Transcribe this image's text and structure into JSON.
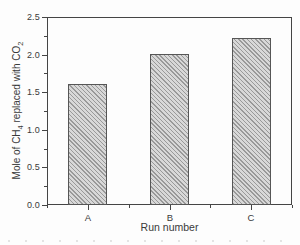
{
  "figure": {
    "background": "#fdfdfd",
    "axis_color": "#454545",
    "text_color": "#3a3a3a",
    "bar_fill": "#d8d8d8",
    "bar_hatch_color": "#999999",
    "bar_border_color": "#565656"
  },
  "chart_data": {
    "type": "bar",
    "title": "",
    "categories": [
      "A",
      "B",
      "C"
    ],
    "values": [
      1.61,
      2.01,
      2.22
    ],
    "xlabel": "Run number",
    "ylabel": "Mole of CH4 replaced with CO2",
    "ylabel_parts": [
      "Mole of CH",
      "4",
      " replaced with CO",
      "2"
    ],
    "ylim": [
      0,
      2.5
    ],
    "y_tick_labels": [
      "0.0",
      "0.5",
      "1.0",
      "1.5",
      "2.0",
      "2.5"
    ],
    "y_major_ticks": [
      0,
      0.5,
      1,
      1.5,
      2,
      2.5
    ],
    "y_minor_ticks": [
      0.25,
      0.75,
      1.25,
      1.75,
      2.25
    ],
    "x_minor_fractions": [
      0,
      0.3333,
      0.6667,
      1
    ],
    "grid": false,
    "legend": false,
    "hatch": "fine-diagonal"
  }
}
